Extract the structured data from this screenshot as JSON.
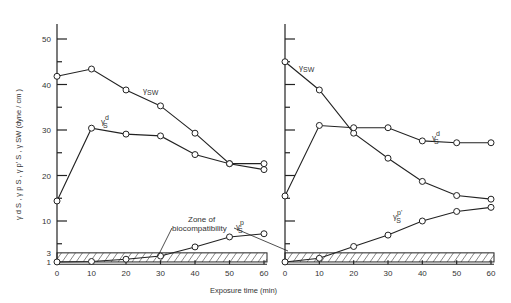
{
  "chart_data": [
    {
      "type": "line",
      "panel": "left",
      "xlabel": "Exposure time (min)",
      "ylabel": "γdS, γpS, γp'S, γSW (dyne / cm)",
      "x": [
        0,
        10,
        20,
        30,
        40,
        50,
        60
      ],
      "x_ticks": [
        "0",
        "10",
        "20",
        "30",
        "40",
        "50",
        "60"
      ],
      "y_ticks": [
        "1",
        "3",
        "10",
        "20",
        "30",
        "40",
        "50"
      ],
      "ylim": [
        0,
        55
      ],
      "grid": false,
      "series": [
        {
          "name": "γSW",
          "values": [
            41.8,
            43.4,
            38.8,
            35.3,
            29.3,
            22.6,
            21.3
          ]
        },
        {
          "name": "γdS",
          "values": [
            14.4,
            30.4,
            29.1,
            28.7,
            24.6,
            22.6,
            22.6
          ]
        },
        {
          "name": "γpS",
          "values": [
            1.0,
            1.1,
            1.6,
            2.3,
            4.3,
            6.5,
            7.2
          ]
        }
      ],
      "annotations": [
        {
          "text": "Zone of biocompatibility",
          "range_y": [
            1,
            3
          ]
        }
      ]
    },
    {
      "type": "line",
      "panel": "right",
      "xlabel": "Exposure time (min)",
      "x": [
        0,
        10,
        20,
        30,
        40,
        50,
        60
      ],
      "x_ticks": [
        "0",
        "10",
        "20",
        "30",
        "40",
        "50",
        "60"
      ],
      "ylim": [
        0,
        55
      ],
      "grid": false,
      "series": [
        {
          "name": "γSW",
          "values": [
            45.0,
            38.8,
            29.3,
            23.8,
            18.7,
            15.6,
            14.8
          ]
        },
        {
          "name": "γdS",
          "values": [
            15.5,
            31.0,
            30.5,
            30.5,
            27.6,
            27.2,
            27.2
          ]
        },
        {
          "name": "γp'S",
          "values": [
            1.0,
            1.8,
            4.4,
            6.9,
            10.0,
            12.1,
            13.0
          ]
        }
      ],
      "annotations": [
        {
          "text": "Zone of biocompatibility",
          "range_y": [
            1,
            3
          ]
        }
      ]
    }
  ],
  "labels": {
    "xlabel": "Exposure time (min)",
    "ylabel": "γ d S , γ p S , γ p' S , γ SW   (dyne / cm )",
    "zone_line1": "Zone of",
    "zone_line2": "biocompatibility",
    "gamma": "γ",
    "sw": "SW",
    "s": "S",
    "d": "d",
    "p": "p",
    "pprime": "p'"
  }
}
